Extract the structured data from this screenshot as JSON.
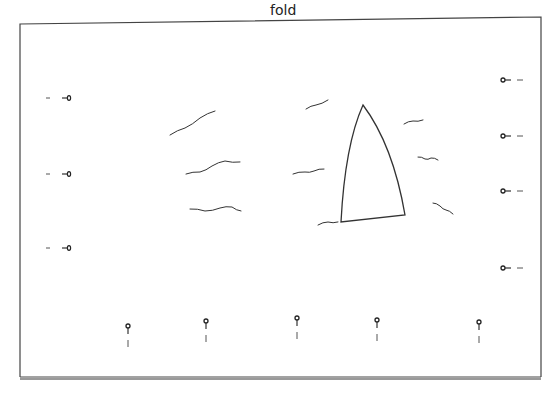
{
  "diagram": {
    "fold_label": "fold",
    "colors": {
      "line": "#333333",
      "border": "#444444",
      "bottom_shadow": "#999999",
      "background": "#ffffff"
    },
    "border": {
      "left": 20,
      "top_left_y": 24,
      "right": 541,
      "top_right_y": 17,
      "bottom": 377
    },
    "sail": {
      "apex": [
        363,
        105
      ],
      "bottom_left": [
        341,
        222
      ],
      "bottom_right": [
        405,
        215
      ]
    },
    "waves": [
      {
        "id": "wave-1",
        "points": "170,135 185,128 200,118 215,111"
      },
      {
        "id": "wave-2",
        "points": "186,174 200,172 212,166 225,161 240,162"
      },
      {
        "id": "wave-3",
        "points": "190,209 205,211 220,208 232,207 241,211"
      },
      {
        "id": "wave-4",
        "points": "306,109 316,105 328,100"
      },
      {
        "id": "wave-5",
        "points": "293,174 305,172 314,171 324,169"
      },
      {
        "id": "wave-6",
        "points": "318,225 328,222 338,222"
      },
      {
        "id": "wave-7",
        "points": "404,124 413,121 423,120"
      },
      {
        "id": "wave-8",
        "points": "418,157 425,159 431,158 438,160"
      },
      {
        "id": "wave-9",
        "points": "433,203 440,206 446,210 453,214"
      }
    ],
    "pins_left": [
      {
        "id": "left-pin-1",
        "x": 68,
        "y": 98
      },
      {
        "id": "left-pin-2",
        "x": 68,
        "y": 174
      },
      {
        "id": "left-pin-3",
        "x": 68,
        "y": 248
      }
    ],
    "pins_right": [
      {
        "id": "right-pin-1",
        "x": 503,
        "y": 80
      },
      {
        "id": "right-pin-2",
        "x": 503,
        "y": 136
      },
      {
        "id": "right-pin-3",
        "x": 503,
        "y": 191
      },
      {
        "id": "right-pin-4",
        "x": 503,
        "y": 268
      }
    ],
    "pins_bottom": [
      {
        "id": "bottom-pin-1",
        "x": 128,
        "y": 326
      },
      {
        "id": "bottom-pin-2",
        "x": 206,
        "y": 321
      },
      {
        "id": "bottom-pin-3",
        "x": 297,
        "y": 318
      },
      {
        "id": "bottom-pin-4",
        "x": 377,
        "y": 320
      },
      {
        "id": "bottom-pin-5",
        "x": 479,
        "y": 322
      }
    ]
  }
}
